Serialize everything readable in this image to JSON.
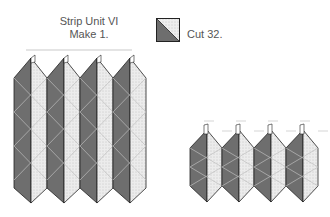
{
  "strip_unit": {
    "title_line1": "Strip Unit VI",
    "title_line2": "Make 1."
  },
  "legend": {
    "label": "Cut 32.",
    "swatch": "half-square-triangle"
  },
  "colors": {
    "dark": "#6e6e6e",
    "light": "#e9e9e9",
    "outline": "#222222",
    "seam": "#bdbdbd"
  },
  "figures": [
    {
      "name": "assembled-strip",
      "columns": 4
    },
    {
      "name": "pressed-strip",
      "columns": 4
    }
  ]
}
